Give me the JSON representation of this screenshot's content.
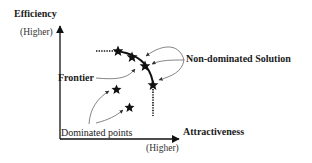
{
  "diagram": {
    "y_axis": {
      "title": "Efficiency",
      "direction": "(Higher)"
    },
    "x_axis": {
      "title": "Attractiveness",
      "direction": "(Higher)"
    },
    "annotations": {
      "frontier": "Frontier",
      "non_dominated": "Non-dominated Solution",
      "dominated": "Dominated points"
    },
    "frontier_points": [
      {
        "x": 118,
        "y": 51
      },
      {
        "x": 132,
        "y": 57
      },
      {
        "x": 145,
        "y": 66
      },
      {
        "x": 153,
        "y": 85
      }
    ],
    "dominated_points": [
      {
        "x": 117,
        "y": 90
      },
      {
        "x": 130,
        "y": 108
      }
    ],
    "colors": {
      "ink": "#1a1a1a",
      "arrow": "#555555",
      "background": "#ffffff"
    }
  }
}
